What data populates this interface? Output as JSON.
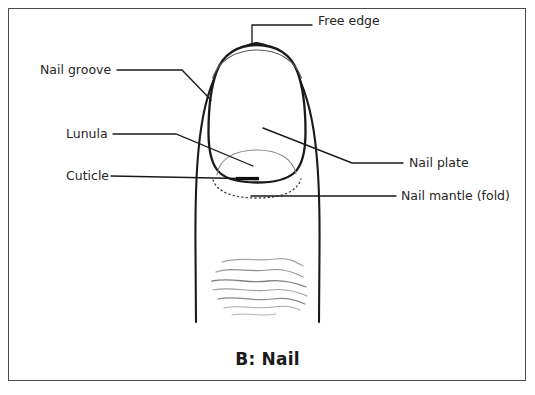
{
  "figure": {
    "caption": "B: Nail",
    "border_color": "#4a4a4a",
    "background_color": "#ffffff",
    "ink_color": "#1a1a1a",
    "wrinkle_color": "#9a9a9a",
    "width": 535,
    "height": 395
  },
  "labels": [
    {
      "id": "free-edge",
      "text": "Free edge",
      "side": "top-right",
      "text_x": 318,
      "text_y": 21,
      "leader": "elbow-down-to-nail-tip"
    },
    {
      "id": "nail-groove",
      "text": "Nail groove",
      "side": "left",
      "text_x": 40,
      "text_y": 66,
      "leader": "horizontal-then-diagonal-to-left-nail-fold"
    },
    {
      "id": "lunula",
      "text": "Lunula",
      "side": "left",
      "text_x": 66,
      "text_y": 130,
      "leader": "horizontal-then-diagonal-down-to-lunula-arc"
    },
    {
      "id": "cuticle",
      "text": "Cuticle",
      "side": "left",
      "text_x": 66,
      "text_y": 172,
      "leader": "horizontal-to-cuticle-bar"
    },
    {
      "id": "nail-plate",
      "text": "Nail plate",
      "side": "right",
      "text_x": 409,
      "text_y": 155,
      "leader": "diagonal-from-nail-body-then-horizontal"
    },
    {
      "id": "nail-mantle-fold",
      "text": "Nail mantle (fold)",
      "side": "right",
      "text_x": 401,
      "text_y": 190,
      "leader": "horizontal-to-below-nail-base"
    }
  ],
  "structures": [
    {
      "id": "finger-outline",
      "name": "finger / fingertip outline"
    },
    {
      "id": "nail-plate-outline",
      "name": "nail plate outline"
    },
    {
      "id": "free-edge-arc",
      "name": "free edge arc"
    },
    {
      "id": "lunula-arc",
      "name": "lunula arc"
    },
    {
      "id": "cuticle-bar",
      "name": "cuticle bar"
    },
    {
      "id": "nail-mantle-dotted-arc",
      "name": "nail mantle dotted arc"
    },
    {
      "id": "skin-wrinkles",
      "name": "fingertip skin wrinkle lines"
    }
  ]
}
